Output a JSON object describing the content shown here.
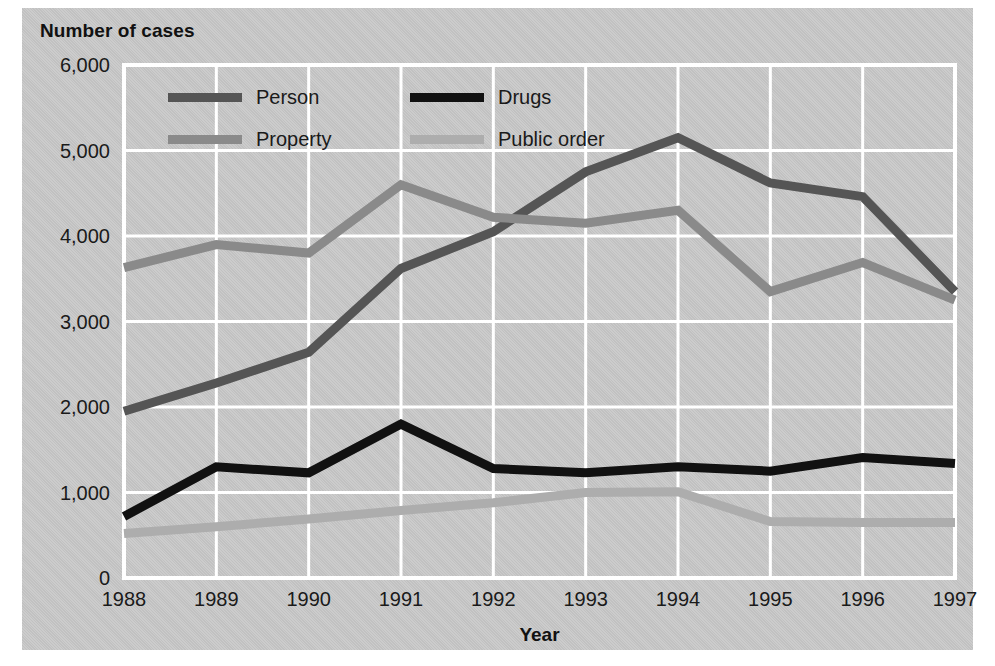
{
  "figure": {
    "y_axis_title": "Number of cases",
    "x_axis_title": "Year",
    "background_color": "#c9c9c9",
    "grid_color": "#ffffff"
  },
  "legend": {
    "items": [
      {
        "label": "Person",
        "color": "#555555"
      },
      {
        "label": "Drugs",
        "color": "#111111"
      },
      {
        "label": "Property",
        "color": "#8a8a8a"
      },
      {
        "label": "Public order",
        "color": "#adadad"
      }
    ]
  },
  "chart_data": {
    "type": "line",
    "title": "",
    "xlabel": "Year",
    "ylabel": "Number of cases",
    "categories": [
      "1988",
      "1989",
      "1990",
      "1991",
      "1992",
      "1993",
      "1994",
      "1995",
      "1996",
      "1997"
    ],
    "x": [
      1988,
      1989,
      1990,
      1991,
      1992,
      1993,
      1994,
      1995,
      1996,
      1997
    ],
    "xlim": [
      1988,
      1997
    ],
    "ylim": [
      0,
      6000
    ],
    "yticks": [
      "0",
      "1,000",
      "2,000",
      "3,000",
      "4,000",
      "5,000",
      "6,000"
    ],
    "ytick_values": [
      0,
      1000,
      2000,
      3000,
      4000,
      5000,
      6000
    ],
    "grid": true,
    "legend_position": "top-left-inside",
    "series": [
      {
        "name": "Person",
        "color": "#555555",
        "width": 9,
        "values": [
          1950,
          2280,
          2640,
          3620,
          4050,
          4750,
          5150,
          4620,
          4460,
          3350
        ]
      },
      {
        "name": "Drugs",
        "color": "#111111",
        "width": 9,
        "values": [
          720,
          1300,
          1230,
          1800,
          1280,
          1230,
          1300,
          1250,
          1410,
          1340
        ]
      },
      {
        "name": "Property",
        "color": "#8a8a8a",
        "width": 9,
        "values": [
          3630,
          3900,
          3800,
          4600,
          4220,
          4150,
          4300,
          3350,
          3690,
          3250
        ]
      },
      {
        "name": "Public order",
        "color": "#adadad",
        "width": 9,
        "values": [
          520,
          600,
          690,
          790,
          880,
          1000,
          1010,
          660,
          650,
          650
        ]
      }
    ]
  }
}
